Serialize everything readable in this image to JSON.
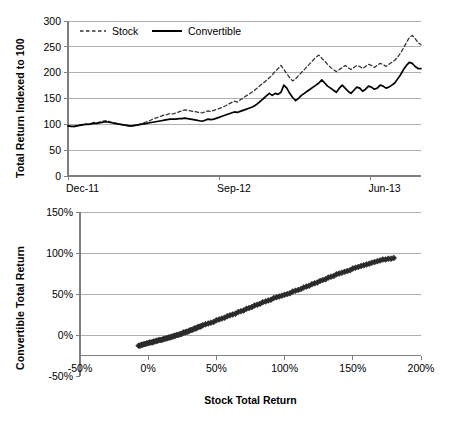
{
  "chart_data": [
    {
      "id": "indexed-total-return",
      "type": "line",
      "title": "",
      "xlabel": "",
      "ylabel": "Total Return Indexed to 100",
      "ylim": [
        0,
        300
      ],
      "ytick_labels": [
        "0",
        "50",
        "100",
        "150",
        "200",
        "250",
        "300"
      ],
      "ytick_values": [
        0,
        50,
        100,
        150,
        200,
        250,
        300
      ],
      "xtick_labels": [
        "Dec-11",
        "Sep-12",
        "Jun-13"
      ],
      "xtick_positions": [
        0,
        0.428,
        0.857
      ],
      "grid": "horizontal",
      "legend_position": "top-inside",
      "legend": [
        "Stock",
        "Convertible"
      ],
      "series": [
        {
          "name": "Stock",
          "style": "dashed",
          "color": "#333333",
          "values": [
            97,
            96,
            95,
            97,
            99,
            100,
            101,
            100,
            102,
            104,
            103,
            105,
            106,
            107,
            106,
            104,
            103,
            101,
            100,
            99,
            98,
            97,
            97,
            98,
            99,
            101,
            103,
            105,
            107,
            110,
            112,
            114,
            116,
            118,
            119,
            121,
            120,
            122,
            124,
            126,
            128,
            127,
            126,
            125,
            124,
            123,
            122,
            124,
            126,
            125,
            127,
            129,
            131,
            133,
            136,
            139,
            142,
            145,
            143,
            147,
            151,
            155,
            158,
            162,
            166,
            171,
            176,
            180,
            185,
            190,
            196,
            202,
            208,
            214,
            206,
            198,
            190,
            184,
            188,
            194,
            200,
            206,
            212,
            218,
            224,
            230,
            234,
            228,
            222,
            216,
            210,
            206,
            202,
            206,
            210,
            214,
            210,
            206,
            210,
            214,
            212,
            208,
            212,
            216,
            214,
            210,
            214,
            218,
            216,
            212,
            216,
            220,
            224,
            230,
            238,
            248,
            258,
            268,
            272,
            266,
            258,
            254
          ]
        },
        {
          "name": "Convertible",
          "style": "solid",
          "color": "#000000",
          "values": [
            97,
            96,
            96,
            97,
            98,
            99,
            100,
            100,
            101,
            102,
            102,
            103,
            104,
            105,
            104,
            103,
            102,
            101,
            100,
            99,
            98,
            97,
            97,
            98,
            99,
            100,
            101,
            102,
            103,
            104,
            105,
            106,
            107,
            108,
            109,
            110,
            110,
            110,
            111,
            111,
            112,
            111,
            110,
            109,
            108,
            107,
            106,
            108,
            110,
            109,
            110,
            112,
            114,
            116,
            118,
            120,
            122,
            124,
            123,
            125,
            127,
            129,
            131,
            133,
            136,
            140,
            145,
            150,
            155,
            160,
            156,
            160,
            158,
            162,
            176,
            170,
            160,
            152,
            146,
            150,
            156,
            160,
            164,
            168,
            172,
            176,
            180,
            186,
            180,
            174,
            170,
            166,
            162,
            170,
            176,
            170,
            164,
            160,
            166,
            172,
            170,
            164,
            168,
            174,
            172,
            168,
            170,
            176,
            174,
            170,
            172,
            176,
            180,
            188,
            196,
            206,
            214,
            220,
            218,
            212,
            208,
            208
          ]
        }
      ]
    },
    {
      "id": "convertible-vs-stock-scatter",
      "type": "scatter",
      "title": "",
      "xlabel": "Stock Total Return",
      "ylabel": "Convertible Total Return",
      "xlim": [
        -50,
        200
      ],
      "ylim": [
        -50,
        150
      ],
      "xtick_labels": [
        "-50%",
        "0%",
        "50%",
        "100%",
        "150%",
        "200%"
      ],
      "xtick_values": [
        -50,
        0,
        50,
        100,
        150,
        200
      ],
      "ytick_labels": [
        "-50%",
        "0%",
        "50%",
        "100%",
        "150%"
      ],
      "ytick_values": [
        -50,
        0,
        50,
        100,
        150
      ],
      "grid": "horizontal",
      "marker": "diamond",
      "marker_color": "#2b2b2b",
      "points": [
        [
          -7,
          -13
        ],
        [
          -6,
          -13
        ],
        [
          -5,
          -12
        ],
        [
          -4,
          -12
        ],
        [
          -3,
          -11
        ],
        [
          -2,
          -11
        ],
        [
          -1,
          -10
        ],
        [
          0,
          -10
        ],
        [
          1,
          -9
        ],
        [
          2,
          -9
        ],
        [
          3,
          -9
        ],
        [
          4,
          -8
        ],
        [
          5,
          -8
        ],
        [
          6,
          -7
        ],
        [
          7,
          -7
        ],
        [
          8,
          -6
        ],
        [
          9,
          -6
        ],
        [
          10,
          -6
        ],
        [
          11,
          -5
        ],
        [
          12,
          -5
        ],
        [
          13,
          -4
        ],
        [
          14,
          -4
        ],
        [
          15,
          -3
        ],
        [
          16,
          -3
        ],
        [
          17,
          -2
        ],
        [
          18,
          -2
        ],
        [
          19,
          -1
        ],
        [
          20,
          -1
        ],
        [
          21,
          0
        ],
        [
          22,
          0
        ],
        [
          23,
          1
        ],
        [
          24,
          1
        ],
        [
          25,
          2
        ],
        [
          26,
          3
        ],
        [
          27,
          3
        ],
        [
          28,
          4
        ],
        [
          29,
          4
        ],
        [
          30,
          5
        ],
        [
          31,
          6
        ],
        [
          32,
          6
        ],
        [
          33,
          7
        ],
        [
          34,
          8
        ],
        [
          35,
          8
        ],
        [
          36,
          9
        ],
        [
          37,
          10
        ],
        [
          38,
          10
        ],
        [
          39,
          11
        ],
        [
          40,
          12
        ],
        [
          42,
          13
        ],
        [
          44,
          14
        ],
        [
          46,
          15
        ],
        [
          48,
          16
        ],
        [
          50,
          18
        ],
        [
          52,
          19
        ],
        [
          54,
          20
        ],
        [
          56,
          21
        ],
        [
          58,
          23
        ],
        [
          60,
          24
        ],
        [
          62,
          25
        ],
        [
          64,
          26
        ],
        [
          66,
          28
        ],
        [
          68,
          29
        ],
        [
          70,
          30
        ],
        [
          72,
          32
        ],
        [
          74,
          33
        ],
        [
          76,
          34
        ],
        [
          78,
          36
        ],
        [
          80,
          37
        ],
        [
          82,
          38
        ],
        [
          84,
          40
        ],
        [
          86,
          41
        ],
        [
          88,
          42
        ],
        [
          90,
          43
        ],
        [
          92,
          45
        ],
        [
          94,
          46
        ],
        [
          96,
          47
        ],
        [
          98,
          48
        ],
        [
          100,
          49
        ],
        [
          102,
          50
        ],
        [
          104,
          51
        ],
        [
          106,
          53
        ],
        [
          108,
          54
        ],
        [
          110,
          55
        ],
        [
          112,
          56
        ],
        [
          114,
          58
        ],
        [
          116,
          59
        ],
        [
          118,
          60
        ],
        [
          120,
          62
        ],
        [
          122,
          63
        ],
        [
          124,
          64
        ],
        [
          126,
          66
        ],
        [
          128,
          67
        ],
        [
          130,
          68
        ],
        [
          132,
          70
        ],
        [
          134,
          71
        ],
        [
          136,
          72
        ],
        [
          138,
          74
        ],
        [
          140,
          75
        ],
        [
          142,
          76
        ],
        [
          144,
          77
        ],
        [
          146,
          78
        ],
        [
          148,
          79
        ],
        [
          150,
          81
        ],
        [
          152,
          82
        ],
        [
          154,
          83
        ],
        [
          156,
          84
        ],
        [
          158,
          85
        ],
        [
          160,
          86
        ],
        [
          162,
          87
        ],
        [
          164,
          88
        ],
        [
          166,
          89
        ],
        [
          168,
          90
        ],
        [
          170,
          91
        ],
        [
          172,
          92
        ],
        [
          174,
          92
        ],
        [
          176,
          93
        ],
        [
          178,
          93
        ],
        [
          180,
          94
        ]
      ],
      "trend_visible": true
    }
  ],
  "axes": {
    "top": {
      "ylabel": "Total Return Indexed to 100",
      "yticks": [
        "300",
        "250",
        "200",
        "150",
        "100",
        "50",
        "0"
      ],
      "xticks": [
        "Dec-11",
        "Sep-12",
        "Jun-13"
      ],
      "legend": {
        "stock": "Stock",
        "convertible": "Convertible"
      }
    },
    "bottom": {
      "ylabel": "Convertible Total Return",
      "xlabel": "Stock Total Return",
      "yticks": [
        "150%",
        "100%",
        "50%",
        "0%",
        "-50%"
      ],
      "xticks": [
        "-50%",
        "0%",
        "50%",
        "100%",
        "150%",
        "200%"
      ]
    }
  },
  "colors": {
    "stock_line": "#333333",
    "convertible_line": "#000000",
    "grid": "#a6a6a6",
    "axis": "#7f7f7f",
    "marker": "#2b2b2b",
    "background": "#ffffff"
  }
}
